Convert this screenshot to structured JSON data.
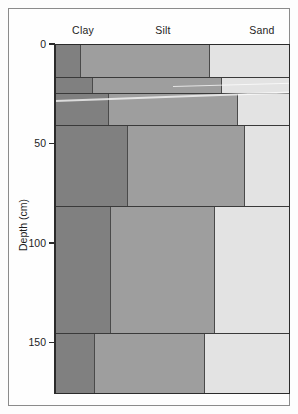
{
  "chart_data": {
    "type": "bar",
    "title": "",
    "subtitle": "",
    "orientation": "horizontal-stacked",
    "xlabel": "",
    "ylabel": "Depth (cm)",
    "ylim": [
      0,
      176
    ],
    "xlim": [
      0,
      100
    ],
    "grid": false,
    "legend_position": "top",
    "axis_inverted_y": true,
    "column_headers": [
      {
        "label": "Clay",
        "center_pct": 12
      },
      {
        "label": "Silt",
        "center_pct": 46
      },
      {
        "label": "Sand",
        "center_pct": 88
      }
    ],
    "y_ticks": [
      {
        "value": 0,
        "label": "0"
      },
      {
        "value": 50,
        "label": "50"
      },
      {
        "value": 100,
        "label": "100"
      },
      {
        "value": 150,
        "label": "150"
      }
    ],
    "series": [
      {
        "name": "Clay",
        "color": "#808080"
      },
      {
        "name": "Silt",
        "color": "#9e9e9e"
      },
      {
        "name": "Sand",
        "color": "#e3e3e3"
      }
    ],
    "categories": [
      "0-10",
      "10-15",
      "15-23",
      "23-58",
      "58-88",
      "88-118",
      "118-145",
      "145-176"
    ],
    "layers": [
      {
        "depth_top": 0,
        "depth_bottom": 17,
        "clay": 11,
        "silt": 55,
        "sand": 34
      },
      {
        "depth_top": 17,
        "depth_bottom": 25,
        "clay": 16,
        "silt": 55,
        "sand": 29
      },
      {
        "depth_top": 25,
        "depth_bottom": 41,
        "clay": 23,
        "silt": 55,
        "sand": 22
      },
      {
        "depth_top": 41,
        "depth_bottom": 82,
        "clay": 31,
        "silt": 50,
        "sand": 19
      },
      {
        "depth_top": 82,
        "depth_bottom": 146,
        "clay": 24,
        "silt": 44,
        "sand": 32
      },
      {
        "depth_top": 146,
        "depth_bottom": 176,
        "clay": 17,
        "silt": 47,
        "sand": 36
      }
    ]
  },
  "colors": {
    "clay": "#808080",
    "silt": "#9e9e9e",
    "sand": "#e3e3e3",
    "axis": "#2b2b2b",
    "frame": "#8b8b8b",
    "segment_border": "#4a4a4a",
    "background": "#fefefe"
  }
}
